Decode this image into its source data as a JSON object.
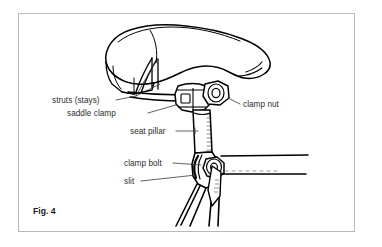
{
  "figure": {
    "caption": "Fig. 4",
    "border_color": "#b9b9b9",
    "background_color": "#ffffff",
    "line_color": "#000000",
    "text_color": "#2c2c2c"
  },
  "labels": [
    {
      "id": "struts",
      "text": "struts (stays)"
    },
    {
      "id": "saddle_clamp",
      "text": "saddle clamp"
    },
    {
      "id": "clamp_nut",
      "text": "clamp nut"
    },
    {
      "id": "seat_pillar",
      "text": "seat pillar"
    },
    {
      "id": "clamp_bolt",
      "text": "clamp bolt"
    },
    {
      "id": "slit",
      "text": "slit"
    }
  ]
}
